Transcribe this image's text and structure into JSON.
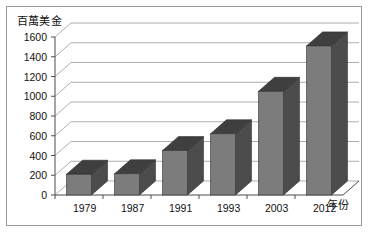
{
  "chart_data": {
    "type": "bar",
    "title": "",
    "subtitle": "",
    "xlabel": "年份",
    "ylabel": "百萬美金",
    "categories": [
      "1979",
      "1987",
      "1991",
      "1993",
      "2003",
      "2012"
    ],
    "values": [
      210,
      215,
      450,
      620,
      1050,
      1510
    ],
    "series": [
      {
        "name": "",
        "values": [
          210,
          215,
          450,
          620,
          1050,
          1510
        ]
      }
    ],
    "ylim": [
      0,
      1600
    ],
    "ytick_labels": [
      "0",
      "200",
      "400",
      "600",
      "800",
      "1000",
      "1200",
      "1400",
      "1600"
    ],
    "ytick_values": [
      0,
      200,
      400,
      600,
      800,
      1000,
      1200,
      1400,
      1600
    ],
    "grid": true,
    "legend": false,
    "legend_position": "none",
    "style": "3d-column",
    "colors": {
      "bar_face": "#7c7c7c",
      "bar_side": "#4c4c4c",
      "bar_top": "#3f3f3f",
      "gridline": "#9a9a9a",
      "axis": "#4d4d4d",
      "frame": "#9b9b9b",
      "background": "#ffffff",
      "text": "#111111"
    }
  }
}
